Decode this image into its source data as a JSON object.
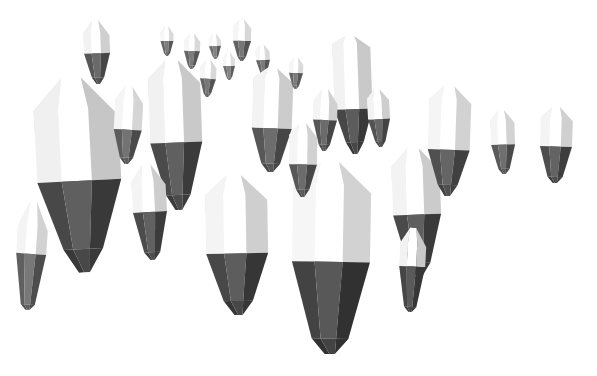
{
  "scene": {
    "title": "Low-poly crystal field",
    "subject": "floating faceted crystal shards",
    "background_color": "#ffffff",
    "width": 597,
    "height": 376,
    "render_style": "flat-shaded polygonal 3d render",
    "lighting": "strong key light from upper left, bright white top facets, dark gray lower facets",
    "object_count": 26
  },
  "palette": {
    "background": "#ffffff",
    "facet_white": "#fdfdfd",
    "facet_light": "#f2f2f2",
    "facet_pale": "#e4e4e4",
    "facet_mid": "#cfcfcf",
    "facet_gray": "#a8a8a8",
    "facet_dark": "#6e6e6e",
    "facet_darker": "#555555",
    "facet_darkest": "#3d3d3d",
    "facet_shadow": "#2e2e2e"
  },
  "crystals": [
    {
      "id": "crystal-large-left",
      "label": "large left crystal",
      "cx": 79,
      "cy": 175,
      "w": 84,
      "h": 195,
      "rot": -3,
      "depth": "foreground",
      "tones": [
        "#ffffff",
        "#f0f0f0",
        "#dedede",
        "#c6c6c6",
        "#5f5f5f",
        "#484848",
        "#393939"
      ],
      "split": 0.53,
      "peak": 0.16,
      "tip": 0.88
    },
    {
      "id": "crystal-far-left-sliver",
      "label": "far left sliver",
      "cx": 31,
      "cy": 256,
      "w": 30,
      "h": 108,
      "rot": 4,
      "depth": "foreground",
      "tones": [
        "#ffffff",
        "#f4f4f4",
        "#e8e8e8",
        "#d2d2d2",
        "#787878",
        "#606060",
        "#4d4d4d"
      ],
      "split": 0.48,
      "peak": 0.22,
      "tip": 0.95
    },
    {
      "id": "crystal-upper-left-small",
      "label": "upper left small crystal",
      "cx": 97,
      "cy": 52,
      "w": 26,
      "h": 64,
      "rot": -2,
      "depth": "midground",
      "tones": [
        "#ffffff",
        "#f2f2f2",
        "#e2e2e2",
        "#cfcfcf",
        "#6a6a6a",
        "#565656",
        "#464646"
      ],
      "split": 0.52,
      "peak": 0.2,
      "tip": 0.9
    },
    {
      "id": "crystal-left-mid-slim",
      "label": "left mid slim crystal",
      "cx": 128,
      "cy": 125,
      "w": 28,
      "h": 78,
      "rot": 3,
      "depth": "midground",
      "tones": [
        "#ffffff",
        "#f5f5f5",
        "#e7e7e7",
        "#d5d5d5",
        "#737373",
        "#5d5d5d",
        "#4a4a4a"
      ],
      "split": 0.56,
      "peak": 0.18,
      "tip": 0.92
    },
    {
      "id": "crystal-center-left-tall",
      "label": "center left tall crystal",
      "cx": 176,
      "cy": 135,
      "w": 52,
      "h": 150,
      "rot": -2,
      "depth": "foreground",
      "tones": [
        "#ffffff",
        "#f1f1f1",
        "#e0e0e0",
        "#c9c9c9",
        "#606060",
        "#4b4b4b",
        "#3b3b3b"
      ],
      "split": 0.55,
      "peak": 0.12,
      "tip": 0.9
    },
    {
      "id": "crystal-tiny-a",
      "label": "tiny background crystal A",
      "cx": 167,
      "cy": 41,
      "w": 13,
      "h": 30,
      "rot": 0,
      "depth": "background",
      "tones": [
        "#ffffff",
        "#f6f6f6",
        "#ebebeb",
        "#dadada",
        "#7d7d7d",
        "#686868",
        "#585858"
      ],
      "split": 0.5,
      "peak": 0.22,
      "tip": 0.9
    },
    {
      "id": "crystal-tiny-b",
      "label": "tiny background crystal B",
      "cx": 192,
      "cy": 51,
      "w": 16,
      "h": 36,
      "rot": 2,
      "depth": "background",
      "tones": [
        "#ffffff",
        "#f6f6f6",
        "#eaeaea",
        "#d9d9d9",
        "#7b7b7b",
        "#666666",
        "#565656"
      ],
      "split": 0.5,
      "peak": 0.2,
      "tip": 0.9
    },
    {
      "id": "crystal-tiny-c",
      "label": "tiny background crystal C",
      "cx": 215,
      "cy": 46,
      "w": 12,
      "h": 26,
      "rot": -2,
      "depth": "background",
      "tones": [
        "#ffffff",
        "#f7f7f7",
        "#ececec",
        "#dcdcdc",
        "#828282",
        "#6d6d6d",
        "#5c5c5c"
      ],
      "split": 0.5,
      "peak": 0.24,
      "tip": 0.9
    },
    {
      "id": "crystal-tiny-d",
      "label": "tiny background crystal D",
      "cx": 242,
      "cy": 40,
      "w": 18,
      "h": 42,
      "rot": 1,
      "depth": "background",
      "tones": [
        "#ffffff",
        "#f5f5f5",
        "#e9e9e9",
        "#d7d7d7",
        "#767676",
        "#626262",
        "#525252"
      ],
      "split": 0.52,
      "peak": 0.18,
      "tip": 0.9
    },
    {
      "id": "crystal-tiny-e",
      "label": "tiny background crystal E",
      "cx": 263,
      "cy": 60,
      "w": 14,
      "h": 32,
      "rot": -3,
      "depth": "background",
      "tones": [
        "#ffffff",
        "#f6f6f6",
        "#ebebeb",
        "#d9d9d9",
        "#7a7a7a",
        "#666666",
        "#555555"
      ],
      "split": 0.5,
      "peak": 0.2,
      "tip": 0.9
    },
    {
      "id": "crystal-center-peak",
      "label": "center peaked crystal",
      "cx": 272,
      "cy": 120,
      "w": 40,
      "h": 104,
      "rot": 2,
      "depth": "midground",
      "tones": [
        "#ffffff",
        "#f3f3f3",
        "#e3e3e3",
        "#cccccc",
        "#6d6d6d",
        "#575757",
        "#464646"
      ],
      "split": 0.58,
      "peak": 0.1,
      "tip": 0.92
    },
    {
      "id": "crystal-center-bottom-wide",
      "label": "center bottom wide crystal",
      "cx": 237,
      "cy": 245,
      "w": 62,
      "h": 140,
      "rot": -1,
      "depth": "foreground",
      "tones": [
        "#ffffff",
        "#f4f4f4",
        "#e6e6e6",
        "#cfcfcf",
        "#5d5d5d",
        "#484848",
        "#363636"
      ],
      "split": 0.56,
      "peak": 0.14,
      "tip": 0.9
    },
    {
      "id": "crystal-hero-center",
      "label": "hero center crystal",
      "cx": 331,
      "cy": 258,
      "w": 78,
      "h": 192,
      "rot": 1,
      "depth": "foreground",
      "tones": [
        "#ffffff",
        "#f6f6f6",
        "#e9e9e9",
        "#d2d2d2",
        "#585858",
        "#434343",
        "#313131"
      ],
      "split": 0.52,
      "peak": 0.12,
      "tip": 0.92
    },
    {
      "id": "crystal-spire-cluster-tall",
      "label": "tall spire of upper cluster",
      "cx": 353,
      "cy": 95,
      "w": 38,
      "h": 118,
      "rot": -2,
      "depth": "midground",
      "tones": [
        "#ffffff",
        "#f2f2f2",
        "#e1e1e1",
        "#c9c9c9",
        "#5c5c5c",
        "#474747",
        "#383838"
      ],
      "split": 0.62,
      "peak": 0.06,
      "tip": 0.9
    },
    {
      "id": "crystal-cluster-left-stub",
      "label": "cluster left stub crystal",
      "cx": 325,
      "cy": 120,
      "w": 24,
      "h": 62,
      "rot": 2,
      "depth": "midground",
      "tones": [
        "#ffffff",
        "#f4f4f4",
        "#e5e5e5",
        "#d0d0d0",
        "#6b6b6b",
        "#575757",
        "#464646"
      ],
      "split": 0.5,
      "peak": 0.2,
      "tip": 0.9
    },
    {
      "id": "crystal-cluster-right-stub",
      "label": "cluster right stub crystal",
      "cx": 379,
      "cy": 118,
      "w": 22,
      "h": 58,
      "rot": -3,
      "depth": "midground",
      "tones": [
        "#ffffff",
        "#f3f3f3",
        "#e4e4e4",
        "#cecece",
        "#676767",
        "#535353",
        "#434343"
      ],
      "split": 0.52,
      "peak": 0.16,
      "tip": 0.9
    },
    {
      "id": "crystal-tiny-f",
      "label": "tiny background crystal F",
      "cx": 296,
      "cy": 73,
      "w": 14,
      "h": 32,
      "rot": 2,
      "depth": "background",
      "tones": [
        "#ffffff",
        "#f6f6f6",
        "#ebebeb",
        "#dadada",
        "#7c7c7c",
        "#686868",
        "#585858"
      ],
      "split": 0.5,
      "peak": 0.2,
      "tip": 0.9
    },
    {
      "id": "crystal-right-of-hero",
      "label": "crystal right of hero",
      "cx": 417,
      "cy": 212,
      "w": 48,
      "h": 128,
      "rot": -2,
      "depth": "foreground",
      "tones": [
        "#ffffff",
        "#f3f3f3",
        "#e3e3e3",
        "#cbcbcb",
        "#5f5f5f",
        "#4a4a4a",
        "#3a3a3a"
      ],
      "split": 0.52,
      "peak": 0.14,
      "tip": 0.9
    },
    {
      "id": "crystal-right-mid",
      "label": "right midground crystal",
      "cx": 449,
      "cy": 141,
      "w": 42,
      "h": 110,
      "rot": 2,
      "depth": "midground",
      "tones": [
        "#ffffff",
        "#f5f5f5",
        "#e8e8e8",
        "#d2d2d2",
        "#656565",
        "#505050",
        "#404040"
      ],
      "split": 0.58,
      "peak": 0.12,
      "tip": 0.9
    },
    {
      "id": "crystal-small-right-a",
      "label": "small right crystal A",
      "cx": 503,
      "cy": 142,
      "w": 24,
      "h": 64,
      "rot": -2,
      "depth": "midground",
      "tones": [
        "#ffffff",
        "#f5f5f5",
        "#e8e8e8",
        "#d3d3d3",
        "#6f6f6f",
        "#5a5a5a",
        "#494949"
      ],
      "split": 0.54,
      "peak": 0.16,
      "tip": 0.92
    },
    {
      "id": "crystal-small-right-b",
      "label": "small right crystal B",
      "cx": 556,
      "cy": 145,
      "w": 32,
      "h": 76,
      "rot": 2,
      "depth": "midground",
      "tones": [
        "#ffffff",
        "#f4f4f4",
        "#e6e6e6",
        "#d0d0d0",
        "#636363",
        "#4e4e4e",
        "#3e3e3e"
      ],
      "split": 0.52,
      "peak": 0.14,
      "tip": 0.92
    },
    {
      "id": "crystal-lower-right-shard",
      "label": "lower right shard",
      "cx": 412,
      "cy": 270,
      "w": 26,
      "h": 84,
      "rot": 3,
      "depth": "foreground",
      "tones": [
        "#ffffff",
        "#f2f2f2",
        "#e2e2e2",
        "#c9c9c9",
        "#5a5a5a",
        "#464646",
        "#373737"
      ],
      "split": 0.46,
      "peak": 0.18,
      "tip": 0.94
    },
    {
      "id": "crystal-below-left-tall",
      "label": "crystal below left tall",
      "cx": 150,
      "cy": 212,
      "w": 34,
      "h": 96,
      "rot": -3,
      "depth": "midground",
      "tones": [
        "#ffffff",
        "#f4f4f4",
        "#e5e5e5",
        "#cdcdcd",
        "#616161",
        "#4c4c4c",
        "#3c3c3c"
      ],
      "split": 0.5,
      "peak": 0.18,
      "tip": 0.92
    },
    {
      "id": "crystal-mid-dip",
      "label": "mid dip crystal",
      "cx": 303,
      "cy": 160,
      "w": 28,
      "h": 74,
      "rot": 1,
      "depth": "midground",
      "tones": [
        "#ffffff",
        "#f5f5f5",
        "#e7e7e7",
        "#d1d1d1",
        "#6c6c6c",
        "#585858",
        "#474747"
      ],
      "split": 0.56,
      "peak": 0.16,
      "tip": 0.9
    },
    {
      "id": "crystal-tiny-g",
      "label": "tiny background crystal G",
      "cx": 229,
      "cy": 66,
      "w": 12,
      "h": 28,
      "rot": -1,
      "depth": "background",
      "tones": [
        "#ffffff",
        "#f7f7f7",
        "#ededed",
        "#dddddd",
        "#848484",
        "#6f6f6f",
        "#5e5e5e"
      ],
      "split": 0.5,
      "peak": 0.22,
      "tip": 0.9
    },
    {
      "id": "crystal-tiny-h",
      "label": "tiny background crystal H",
      "cx": 208,
      "cy": 78,
      "w": 16,
      "h": 38,
      "rot": 3,
      "depth": "background",
      "tones": [
        "#ffffff",
        "#f6f6f6",
        "#eaeaea",
        "#d8d8d8",
        "#787878",
        "#646464",
        "#545454"
      ],
      "split": 0.52,
      "peak": 0.2,
      "tip": 0.9
    }
  ]
}
